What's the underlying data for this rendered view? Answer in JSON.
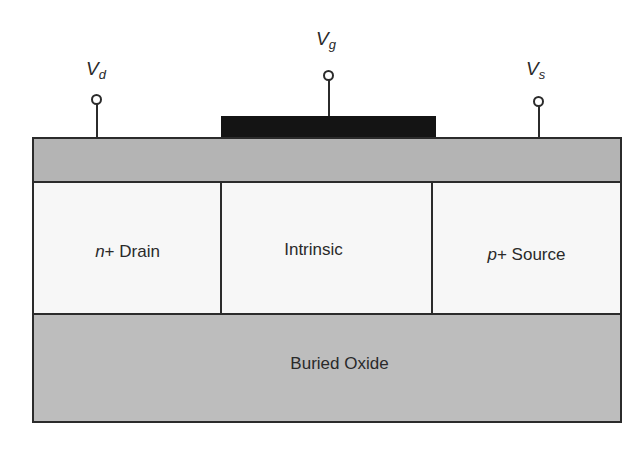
{
  "diagram": {
    "title": "",
    "terminals": [
      {
        "id": "drain",
        "symbol": "V",
        "subscript": "d"
      },
      {
        "id": "gate",
        "symbol": "V",
        "subscript": "g"
      },
      {
        "id": "source",
        "symbol": "V",
        "subscript": "s"
      }
    ],
    "regions": {
      "drain": {
        "prefix": "n",
        "rest": "+ Drain"
      },
      "intrinsic": {
        "label": "Intrinsic"
      },
      "source": {
        "prefix": "p",
        "rest": "+ Source"
      },
      "buried_oxide": {
        "label": "Buried Oxide"
      }
    },
    "colors": {
      "gate": "#141414",
      "gate_oxide": "#b4b4b4",
      "silicon": "#f7f7f7",
      "buried_oxide": "#bdbdbd",
      "outline": "#2b2b2b"
    }
  }
}
